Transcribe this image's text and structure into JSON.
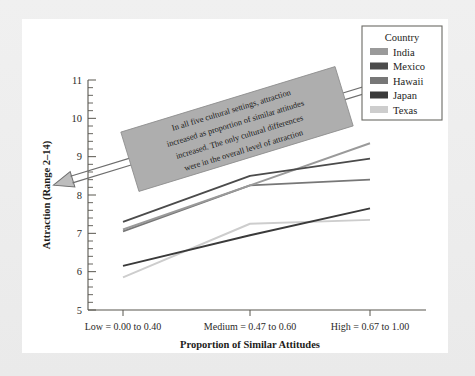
{
  "chart_data": {
    "type": "line",
    "title": "",
    "xlabel": "Proportion of Similar Attitudes",
    "ylabel": "Attraction (Range 2–14)",
    "categories": [
      "Low = 0.00 to 0.40",
      "Medium = 0.47 to 0.60",
      "High = 0.67 to 1.00"
    ],
    "ylim": [
      5,
      11
    ],
    "yticks": [
      5,
      6,
      7,
      8,
      9,
      10,
      11
    ],
    "ytick_labels": [
      "5",
      "6",
      "7",
      "8",
      "9",
      "10",
      "11"
    ],
    "y_minor_step": 0.2,
    "grid": false,
    "legend_position": "top-right",
    "legend_title": "Country",
    "series": [
      {
        "name": "India",
        "color": "#9a9a9a",
        "values": [
          7.1,
          8.25,
          9.35
        ]
      },
      {
        "name": "Mexico",
        "color": "#4b4b4b",
        "values": [
          7.3,
          8.5,
          8.95
        ]
      },
      {
        "name": "Hawaii",
        "color": "#777777",
        "values": [
          7.05,
          8.25,
          8.4
        ]
      },
      {
        "name": "Japan",
        "color": "#3a3a3a",
        "values": [
          6.15,
          6.95,
          7.65
        ]
      },
      {
        "name": "Texas",
        "color": "#cdcdcd",
        "values": [
          5.85,
          7.25,
          7.35
        ]
      }
    ],
    "annotation": {
      "lines": [
        "In all five cultural settings, attraction",
        "increased as proportion of similar attitudes",
        "increased. The only cultural differences",
        "were in the overall level of attraction"
      ],
      "full_text": "In all five cultural settings, attraction increased as proportion of similar attitudes increased. The only cultural differences were in the overall level of attraction",
      "style": "double-headed-arrow-banner",
      "fill_color": "#aeaeae"
    }
  },
  "axes": {
    "y_title": "Attraction (Range 2–14)",
    "x_title": "Proportion of Similar Attitudes",
    "y_labels": [
      "11",
      "10",
      "9",
      "8",
      "7",
      "6",
      "5"
    ],
    "x_labels": [
      "Low = 0.00 to 0.40",
      "Medium = 0.47 to 0.60",
      "High = 0.67 to 1.00"
    ]
  },
  "legend": {
    "title": "Country",
    "items": [
      {
        "label": "India",
        "swatch": "#9a9a9a"
      },
      {
        "label": "Mexico",
        "swatch": "#4b4b4b"
      },
      {
        "label": "Hawaii",
        "swatch": "#777777"
      },
      {
        "label": "Japan",
        "swatch": "#3a3a3a"
      },
      {
        "label": "Texas",
        "swatch": "#cdcdcd"
      }
    ]
  },
  "annotation": {
    "line1": "In all five cultural settings, attraction",
    "line2": "increased as proportion of similar attitudes",
    "line3": "increased. The only cultural differences",
    "line4": "were in the overall level of attraction"
  }
}
